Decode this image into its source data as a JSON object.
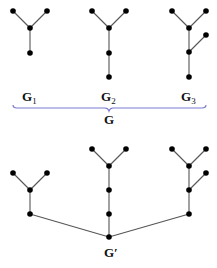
{
  "diagram": {
    "top_graphs": [
      {
        "label": "G",
        "subscript": "1",
        "nodes": [
          [
            13,
            11
          ],
          [
            47,
            11
          ],
          [
            30,
            28
          ],
          [
            30,
            53
          ]
        ],
        "edges": [
          [
            0,
            2
          ],
          [
            1,
            2
          ],
          [
            2,
            3
          ]
        ]
      },
      {
        "label": "G",
        "subscript": "2",
        "nodes": [
          [
            92,
            11
          ],
          [
            126,
            11
          ],
          [
            109,
            28
          ],
          [
            109,
            53
          ],
          [
            109,
            77
          ]
        ],
        "edges": [
          [
            0,
            2
          ],
          [
            1,
            2
          ],
          [
            2,
            3
          ],
          [
            3,
            4
          ]
        ]
      },
      {
        "label": "G",
        "subscript": "3",
        "nodes": [
          [
            172,
            11
          ],
          [
            206,
            11
          ],
          [
            189,
            28
          ],
          [
            206,
            35
          ],
          [
            189,
            52
          ],
          [
            189,
            77
          ]
        ],
        "edges": [
          [
            0,
            2
          ],
          [
            1,
            2
          ],
          [
            2,
            4
          ],
          [
            3,
            4
          ],
          [
            4,
            5
          ]
        ]
      }
    ],
    "group_label": "G",
    "combined_label": "G′",
    "combined_graph": {
      "nodes": [
        [
          13,
          173
        ],
        [
          47,
          173
        ],
        [
          30,
          190
        ],
        [
          30,
          214
        ],
        [
          92,
          149
        ],
        [
          126,
          149
        ],
        [
          109,
          166
        ],
        [
          109,
          190
        ],
        [
          109,
          214
        ],
        [
          109,
          237
        ],
        [
          172,
          149
        ],
        [
          206,
          149
        ],
        [
          189,
          166
        ],
        [
          206,
          173
        ],
        [
          189,
          190
        ],
        [
          189,
          214
        ]
      ],
      "edges": [
        [
          0,
          2
        ],
        [
          1,
          2
        ],
        [
          2,
          3
        ],
        [
          3,
          9
        ],
        [
          4,
          6
        ],
        [
          5,
          6
        ],
        [
          6,
          7
        ],
        [
          7,
          8
        ],
        [
          8,
          9
        ],
        [
          10,
          12
        ],
        [
          11,
          12
        ],
        [
          12,
          14
        ],
        [
          13,
          14
        ],
        [
          14,
          15
        ],
        [
          15,
          9
        ]
      ]
    },
    "colors": {
      "brace": "#7a7ad2",
      "node": "#000000",
      "edge": "#555555"
    }
  }
}
